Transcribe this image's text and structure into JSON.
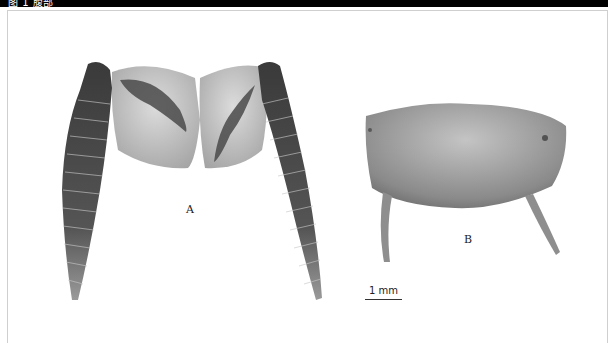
{
  "caption": {
    "text": "图 1 腹部 ",
    "background": "#000000",
    "color": "#ffffff"
  },
  "figure": {
    "panels": [
      {
        "id": "A",
        "label": "A",
        "description": "paired segmented appendages with basal plates"
      },
      {
        "id": "B",
        "label": "B",
        "description": "rounded plate with two slender processes"
      }
    ],
    "scale_bar": {
      "label": "1 mm"
    },
    "colors": {
      "specimen_dark": "#3c3c3c",
      "specimen_mid": "#6e6e6e",
      "specimen_light": "#b9b9b9",
      "frame": "#cfcfcf"
    }
  }
}
